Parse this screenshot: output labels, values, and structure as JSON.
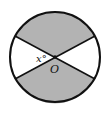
{
  "diagram": {
    "type": "circle-sectors",
    "center_label": "O",
    "angle_label": "x°",
    "colors": {
      "shaded": "#b3b3b3",
      "unshaded": "#ffffff",
      "stroke": "#111111"
    },
    "sectors": [
      {
        "position": "top",
        "shaded": true
      },
      {
        "position": "right",
        "shaded": false
      },
      {
        "position": "bottom",
        "shaded": true
      },
      {
        "position": "left",
        "shaded": false
      }
    ]
  }
}
